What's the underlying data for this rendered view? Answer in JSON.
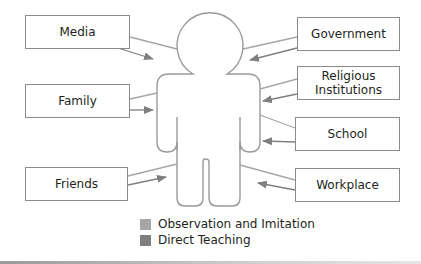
{
  "diagram": {
    "center": {
      "label": "person-figure"
    },
    "sources_left": [
      {
        "label": "Media"
      },
      {
        "label": "Family"
      },
      {
        "label": "Friends"
      }
    ],
    "sources_right": [
      {
        "label": "Government"
      },
      {
        "label": "Religious Institutions",
        "line1": "Religious",
        "line2": "Institutions"
      },
      {
        "label": "School"
      },
      {
        "label": "Workplace"
      }
    ]
  },
  "legend": {
    "items": [
      {
        "label": "Observation and Imitation",
        "color": "#a6a6a6"
      },
      {
        "label": "Direct Teaching",
        "color": "#7f7f7f"
      }
    ]
  },
  "colors": {
    "outline": "#9a9a9a",
    "observation_line": "#a6a6a6",
    "teaching_arrow": "#7f7f7f",
    "text": "#231f20"
  }
}
